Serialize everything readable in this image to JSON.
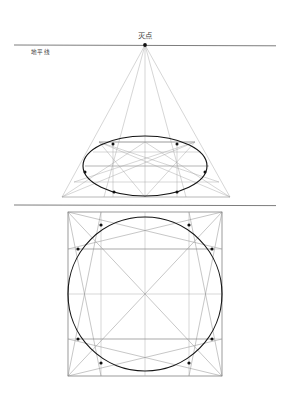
{
  "document": {
    "title": "灭点",
    "type": "perspective-construction-diagram",
    "background_color": "#ffffff"
  },
  "labels": {
    "vanishing_point": "灭点",
    "horizon_line": "地平线"
  },
  "colors": {
    "horizon_line": "#6e6e6e",
    "construction_line": "#9a9a9a",
    "outline": "#4a4a4a",
    "curve": "#1c1c1c",
    "node": "#111111",
    "text": "#3a3a3a"
  },
  "upper_figure": {
    "name": "ellipse-in-perspective",
    "vanishing_point": {
      "x": 145,
      "y": 45
    },
    "horizon_y": 45,
    "horizon_x_start": 14,
    "horizon_x_end": 276,
    "base_y": 197,
    "base_x_left": 62,
    "base_x_right": 230,
    "top_y": 142,
    "top_x_left": 99,
    "top_x_right": 195,
    "ellipse": {
      "cx": 145,
      "cy": 166,
      "rx": 62,
      "ry": 30
    },
    "horizontal_grid_y": [
      142,
      152,
      166,
      182,
      197
    ],
    "radiating_count": 5,
    "nodes": [
      {
        "x": 113,
        "y": 144
      },
      {
        "x": 177,
        "y": 144
      },
      {
        "x": 85,
        "y": 173
      },
      {
        "x": 205,
        "y": 173
      },
      {
        "x": 113,
        "y": 192
      },
      {
        "x": 177,
        "y": 192
      }
    ]
  },
  "lower_figure": {
    "name": "circle-in-square",
    "square": {
      "x": 68,
      "y": 212,
      "width": 154,
      "height": 164
    },
    "circle": {
      "cx": 145,
      "cy": 294,
      "r": 77
    },
    "grid_vertical_x": [
      101,
      145,
      189
    ],
    "grid_horizontal_y": [
      249,
      294,
      339
    ],
    "nodes": [
      {
        "x": 101,
        "y": 225
      },
      {
        "x": 189,
        "y": 225
      },
      {
        "x": 78,
        "y": 249
      },
      {
        "x": 212,
        "y": 249
      },
      {
        "x": 78,
        "y": 339
      },
      {
        "x": 212,
        "y": 339
      },
      {
        "x": 101,
        "y": 363
      },
      {
        "x": 189,
        "y": 363
      }
    ]
  },
  "separator_line": {
    "y": 205,
    "x_start": 14,
    "x_end": 276
  }
}
